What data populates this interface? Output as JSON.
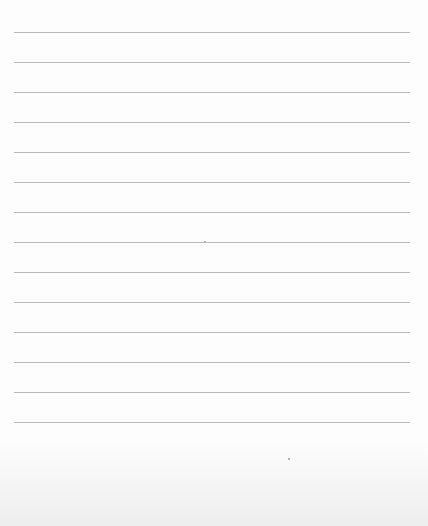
{
  "paper": {
    "type": "lined",
    "line_count": 14,
    "line_color": "#b9b9b9",
    "background_color": "#fdfdfd",
    "lines_y": [
      32,
      62,
      92,
      122,
      152,
      182,
      212,
      242,
      272,
      302,
      332,
      362,
      392,
      422
    ]
  }
}
